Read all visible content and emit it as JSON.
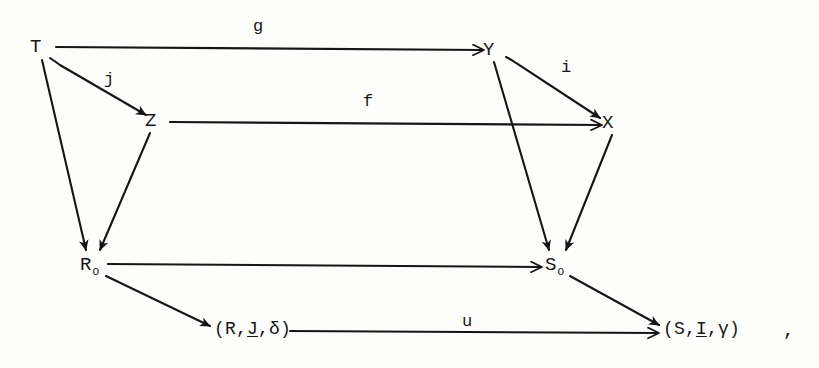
{
  "figure": {
    "kind": "commutative-diagram",
    "background_color": "#fdfdfb",
    "ink_color": "#161616",
    "trailing_punctuation": ",",
    "objects": [
      {
        "id": "T",
        "label": "T",
        "subscript": "",
        "x": 36,
        "y": 48
      },
      {
        "id": "Z",
        "label": "Z",
        "subscript": "",
        "x": 151,
        "y": 122
      },
      {
        "id": "Y",
        "label": "Y",
        "subscript": "",
        "x": 489,
        "y": 51
      },
      {
        "id": "X",
        "label": "X",
        "subscript": "",
        "x": 608,
        "y": 124
      },
      {
        "id": "R0",
        "label": "R",
        "subscript": "o",
        "x": 86,
        "y": 268
      },
      {
        "id": "S0",
        "label": "S",
        "subscript": "o",
        "x": 551,
        "y": 268
      },
      {
        "id": "RJd",
        "label": "(R,J,δ)",
        "subscript": "",
        "x": 219,
        "y": 330
      },
      {
        "id": "SIg",
        "label": "(S,I,γ)",
        "subscript": "",
        "x": 668,
        "y": 330
      }
    ],
    "tuple_left": {
      "open": "(",
      "first": "R",
      "sep1": ",",
      "underlined": "J",
      "sep2": ",",
      "last": "δ",
      "close": ")"
    },
    "tuple_right": {
      "open": "(",
      "first": "S",
      "sep1": ",",
      "underlined": "I",
      "sep2": ",",
      "last": "γ",
      "close": ")"
    },
    "arrows": [
      {
        "id": "g",
        "label": "g",
        "from": "T",
        "to": "Y",
        "label_x": 258,
        "label_y": 27
      },
      {
        "id": "f",
        "label": "f",
        "from": "Z",
        "to": "X",
        "label_x": 368,
        "label_y": 102
      },
      {
        "id": "j",
        "label": "j",
        "from": "T",
        "to": "Z",
        "label_x": 109,
        "label_y": 80
      },
      {
        "id": "i",
        "label": "i",
        "from": "Y",
        "to": "X",
        "label_x": 566,
        "label_y": 68
      },
      {
        "id": "u",
        "label": "u",
        "from": "RJd",
        "to": "SIg",
        "label_x": 467,
        "label_y": 322
      },
      {
        "id": "t_r0",
        "label": "",
        "from": "T",
        "to": "R0",
        "label_x": 0,
        "label_y": 0
      },
      {
        "id": "z_r0",
        "label": "",
        "from": "Z",
        "to": "R0",
        "label_x": 0,
        "label_y": 0
      },
      {
        "id": "y_s0",
        "label": "",
        "from": "Y",
        "to": "S0",
        "label_x": 0,
        "label_y": 0
      },
      {
        "id": "x_s0",
        "label": "",
        "from": "X",
        "to": "S0",
        "label_x": 0,
        "label_y": 0
      },
      {
        "id": "r0_s0",
        "label": "",
        "from": "R0",
        "to": "S0",
        "label_x": 0,
        "label_y": 0
      },
      {
        "id": "r0_rjd",
        "label": "",
        "from": "R0",
        "to": "RJd",
        "label_x": 0,
        "label_y": 0
      },
      {
        "id": "s0_sig",
        "label": "",
        "from": "S0",
        "to": "SIg",
        "label_x": 0,
        "label_y": 0
      }
    ]
  }
}
